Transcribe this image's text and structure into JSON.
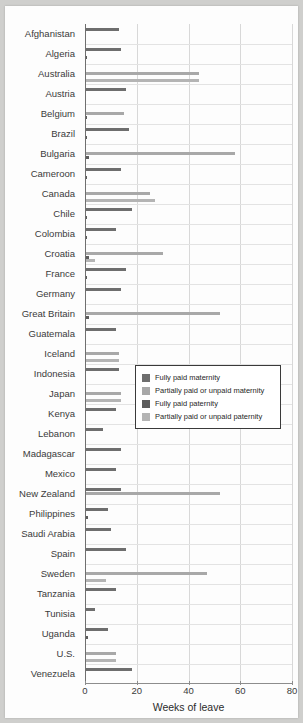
{
  "chart_data": {
    "type": "bar",
    "orientation": "horizontal",
    "title": "",
    "xlabel": "Weeks of leave",
    "ylabel": "",
    "xlim": [
      0,
      80
    ],
    "xticks": [
      0,
      20,
      40,
      60,
      80
    ],
    "grid": true,
    "legend_position": "center-right",
    "series": [
      {
        "name": "Fully paid maternity",
        "color": "#6e6e6e",
        "key": "fm"
      },
      {
        "name": "Partially paid or unpaid maternity",
        "color": "#a8a8a8",
        "key": "pm"
      },
      {
        "name": "Fully paid paternity",
        "color": "#5c5c5c",
        "key": "fp"
      },
      {
        "name": "Partially paid or unpaid paternity",
        "color": "#b4b4b4",
        "key": "pp"
      }
    ],
    "categories": [
      "Afghanistan",
      "Algeria",
      "Australia",
      "Austria",
      "Belgium",
      "Brazil",
      "Bulgaria",
      "Cameroon",
      "Canada",
      "Chile",
      "Colombia",
      "Croatia",
      "France",
      "Germany",
      "Great Britain",
      "Guatemala",
      "Iceland",
      "Indonesia",
      "Japan",
      "Kenya",
      "Lebanon",
      "Madagascar",
      "Mexico",
      "New Zealand",
      "Philippines",
      "Saudi Arabia",
      "Spain",
      "Sweden",
      "Tanzania",
      "Tunisia",
      "Uganda",
      "U.S.",
      "Venezuela"
    ],
    "rows": [
      {
        "country": "Afghanistan",
        "fm": 13,
        "pm": 0,
        "fp": 0.5,
        "pp": 0
      },
      {
        "country": "Algeria",
        "fm": 14,
        "pm": 0,
        "fp": 0.6,
        "pp": 0
      },
      {
        "country": "Australia",
        "fm": 0,
        "pm": 44,
        "fp": 0,
        "pp": 44
      },
      {
        "country": "Austria",
        "fm": 16,
        "pm": 0,
        "fp": 0,
        "pp": 0
      },
      {
        "country": "Belgium",
        "fm": 0,
        "pm": 15,
        "fp": 0.6,
        "pp": 0
      },
      {
        "country": "Brazil",
        "fm": 17,
        "pm": 0,
        "fp": 0.6,
        "pp": 0
      },
      {
        "country": "Bulgaria",
        "fm": 0,
        "pm": 58,
        "fp": 1.5,
        "pp": 0
      },
      {
        "country": "Cameroon",
        "fm": 14,
        "pm": 0,
        "fp": 0.6,
        "pp": 0
      },
      {
        "country": "Canada",
        "fm": 0,
        "pm": 25,
        "fp": 0,
        "pp": 27
      },
      {
        "country": "Chile",
        "fm": 18,
        "pm": 0,
        "fp": 0.8,
        "pp": 0
      },
      {
        "country": "Colombia",
        "fm": 12,
        "pm": 0,
        "fp": 0.8,
        "pp": 0
      },
      {
        "country": "Croatia",
        "fm": 0,
        "pm": 30,
        "fp": 1.5,
        "pp": 4
      },
      {
        "country": "France",
        "fm": 16,
        "pm": 0,
        "fp": 0.6,
        "pp": 0
      },
      {
        "country": "Germany",
        "fm": 14,
        "pm": 0,
        "fp": 0,
        "pp": 0
      },
      {
        "country": "Great Britain",
        "fm": 0,
        "pm": 52,
        "fp": 1.5,
        "pp": 0
      },
      {
        "country": "Guatemala",
        "fm": 12,
        "pm": 0,
        "fp": 0,
        "pp": 0
      },
      {
        "country": "Iceland",
        "fm": 0,
        "pm": 13,
        "fp": 0,
        "pp": 13
      },
      {
        "country": "Indonesia",
        "fm": 13,
        "pm": 0,
        "fp": 0.4,
        "pp": 0
      },
      {
        "country": "Japan",
        "fm": 0,
        "pm": 14,
        "fp": 0,
        "pp": 14
      },
      {
        "country": "Kenya",
        "fm": 12,
        "pm": 0,
        "fp": 0.4,
        "pp": 0
      },
      {
        "country": "Lebanon",
        "fm": 7,
        "pm": 0,
        "fp": 0,
        "pp": 0
      },
      {
        "country": "Madagascar",
        "fm": 14,
        "pm": 0,
        "fp": 0.4,
        "pp": 0
      },
      {
        "country": "Mexico",
        "fm": 12,
        "pm": 0,
        "fp": 0,
        "pp": 0
      },
      {
        "country": "New Zealand",
        "fm": 14,
        "pm": 52,
        "fp": 0.5,
        "pp": 0
      },
      {
        "country": "Philippines",
        "fm": 9,
        "pm": 0,
        "fp": 1,
        "pp": 0
      },
      {
        "country": "Saudi Arabia",
        "fm": 10,
        "pm": 0,
        "fp": 0,
        "pp": 0
      },
      {
        "country": "Spain",
        "fm": 16,
        "pm": 0,
        "fp": 0.5,
        "pp": 0
      },
      {
        "country": "Sweden",
        "fm": 0,
        "pm": 47,
        "fp": 0,
        "pp": 8
      },
      {
        "country": "Tanzania",
        "fm": 12,
        "pm": 0,
        "fp": 0.5,
        "pp": 0
      },
      {
        "country": "Tunisia",
        "fm": 4,
        "pm": 0,
        "fp": 0,
        "pp": 0
      },
      {
        "country": "Uganda",
        "fm": 9,
        "pm": 0,
        "fp": 1,
        "pp": 0
      },
      {
        "country": "U.S.",
        "fm": 0,
        "pm": 12,
        "fp": 0,
        "pp": 12
      },
      {
        "country": "Venezuela",
        "fm": 18,
        "pm": 0,
        "fp": 0.5,
        "pp": 0
      }
    ]
  },
  "legend": {
    "items": [
      "Fully paid maternity",
      "Partially paid or unpaid maternity",
      "Fully paid paternity",
      "Partially paid or unpaid paternity"
    ]
  },
  "axis": {
    "x_title": "Weeks of leave",
    "x_tick_labels": [
      "0",
      "20",
      "40",
      "60",
      "80"
    ]
  }
}
